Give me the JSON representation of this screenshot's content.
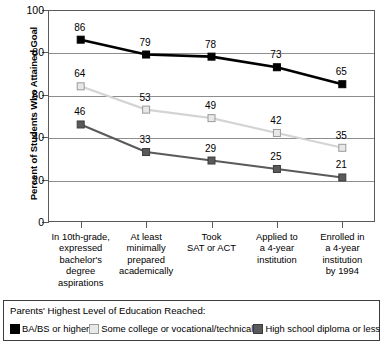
{
  "chart_data": {
    "type": "line",
    "title": "",
    "xlabel": "",
    "ylabel": "Percent of Students Who Attained Goal",
    "ylim": [
      0,
      100
    ],
    "yticks": [
      0,
      20,
      40,
      60,
      80,
      100
    ],
    "grid": true,
    "legend_position": "bottom",
    "legend_title": "Parents' Highest Level of Education Reached:",
    "categories": [
      [
        "In 10th-grade,",
        "expressed",
        "bachelor's",
        "degree",
        "aspirations"
      ],
      [
        "At least",
        "minimally",
        "prepared",
        "academically"
      ],
      [
        "Took",
        "SAT or ACT"
      ],
      [
        "Applied to",
        "a 4-year",
        "institution"
      ],
      [
        "Enrolled in",
        "a 4-year",
        "institution",
        "by 1994"
      ]
    ],
    "series": [
      {
        "name": "BA/BS or higher",
        "values": [
          86,
          79,
          78,
          73,
          65
        ],
        "color": "#000000",
        "marker_fill": "#000000",
        "marker_edge": "#000000"
      },
      {
        "name": "Some college or vocational/technical",
        "values": [
          64,
          53,
          49,
          42,
          35
        ],
        "color": "#d4d4d4",
        "marker_fill": "#e8e8e8",
        "marker_edge": "#9a9a9a"
      },
      {
        "name": "High school diploma or less",
        "values": [
          46,
          33,
          29,
          25,
          21
        ],
        "color": "#5a5a5a",
        "marker_fill": "#5a5a5a",
        "marker_edge": "#3c3c3c"
      }
    ]
  }
}
